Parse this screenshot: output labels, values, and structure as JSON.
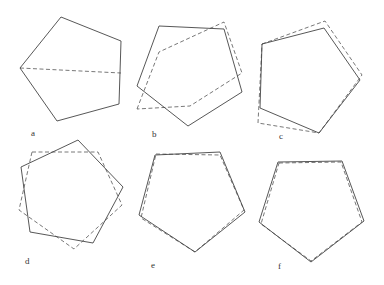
{
  "figure": {
    "panels": [
      {
        "label": "a",
        "label_pos": [
          31,
          136
        ],
        "solid": [
          [
            61,
            17
          ],
          [
            121,
            41
          ],
          [
            119,
            104
          ],
          [
            57,
            121
          ],
          [
            20,
            68
          ]
        ],
        "dashed_line": [
          [
            20,
            68
          ],
          [
            121,
            73
          ]
        ]
      },
      {
        "label": "b",
        "label_pos": [
          152,
          137
        ],
        "solid": [
          [
            159,
            26
          ],
          [
            224,
            29
          ],
          [
            242,
            92
          ],
          [
            188,
            126
          ],
          [
            137,
            86
          ]
        ],
        "dashed": [
          [
            137,
            109
          ],
          [
            159,
            52
          ],
          [
            224,
            22
          ],
          [
            242,
            73
          ],
          [
            190,
            106
          ]
        ]
      },
      {
        "label": "c",
        "label_pos": [
          279,
          139
        ],
        "solid": [
          [
            262,
            44
          ],
          [
            324,
            28
          ],
          [
            360,
            80
          ],
          [
            319,
            133
          ],
          [
            260,
            108
          ]
        ],
        "dashed": [
          [
            262,
            44
          ],
          [
            325,
            21
          ],
          [
            362,
            75
          ],
          [
            319,
            133
          ],
          [
            258,
            123
          ]
        ]
      },
      {
        "label": "d",
        "label_pos": [
          25,
          264
        ],
        "solid": [
          [
            78,
            140
          ],
          [
            123,
            187
          ],
          [
            93,
            243
          ],
          [
            30,
            232
          ],
          [
            21,
            167
          ]
        ],
        "dashed": [
          [
            32,
            152
          ],
          [
            98,
            152
          ],
          [
            122,
            205
          ],
          [
            74,
            249
          ],
          [
            19,
            210
          ]
        ]
      },
      {
        "label": "e",
        "label_pos": [
          151,
          268
        ],
        "solid": [
          [
            155,
            155
          ],
          [
            220,
            152
          ],
          [
            245,
            212
          ],
          [
            195,
            252
          ],
          [
            139,
            215
          ]
        ],
        "dashed": [
          [
            156,
            154
          ],
          [
            220,
            155
          ],
          [
            244,
            210
          ],
          [
            195,
            252
          ],
          [
            141,
            218
          ]
        ]
      },
      {
        "label": "f",
        "label_pos": [
          278,
          269
        ],
        "solid": [
          [
            278,
            162
          ],
          [
            342,
            161
          ],
          [
            364,
            221
          ],
          [
            311,
            262
          ],
          [
            259,
            222
          ]
        ],
        "dashed": [
          [
            279,
            163
          ],
          [
            341,
            162
          ],
          [
            362,
            222
          ],
          [
            311,
            261
          ],
          [
            261,
            224
          ]
        ]
      }
    ]
  }
}
